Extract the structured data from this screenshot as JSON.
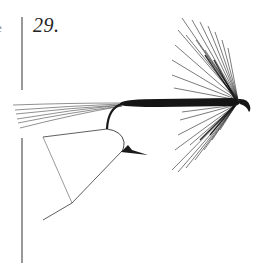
{
  "plate": {
    "number_label": "29.",
    "edge_fragment": "e"
  },
  "illustration": {
    "subject": "wet fly on hook",
    "parts": [
      "tail",
      "body",
      "hackle",
      "hook-eye",
      "hook-bend",
      "barb",
      "gape-gauge"
    ],
    "ink_color": "#1a1a1a",
    "background": "#ffffff"
  }
}
